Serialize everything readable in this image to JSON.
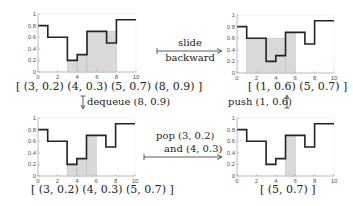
{
  "colors": {
    "line": "#222222",
    "fill": "#d9d9d9",
    "fill_edge": "#b5b5b5",
    "axis": "#9a9a9a",
    "grid": "#ececec"
  },
  "panels": [
    {
      "id": "top-left",
      "deque_label": "[ (3, 0.2) (4, 0.3) (5, 0.7) (8, 0.9) ]"
    },
    {
      "id": "top-right",
      "deque_label": "[ (1, 0.6) (5, 0.7) ]"
    },
    {
      "id": "bottom-left",
      "deque_label": "[ (3, 0.2) (4, 0.3) (5, 0.7) ]"
    },
    {
      "id": "bottom-right",
      "deque_label": "[ (5, 0.7) ]"
    }
  ],
  "operations": {
    "slide_line1": "slide",
    "slide_line2": "backward",
    "dequeue": "dequeue (8, 0.9)",
    "push": "push (1, 0.6)",
    "pop_line1": "pop (3, 0.2)",
    "pop_line2": "and (4, 0.3)"
  },
  "chart_data": [
    {
      "type": "line",
      "title": "top-left",
      "step_function": {
        "x": [
          0,
          1,
          3,
          4,
          5,
          7,
          8,
          10
        ],
        "y": [
          0.8,
          0.6,
          0.2,
          0.3,
          0.7,
          0.5,
          0.9,
          0.9
        ]
      },
      "shaded_steps": [
        {
          "x0": 3,
          "x1": 4,
          "y": 0.2
        },
        {
          "x0": 4,
          "x1": 5,
          "y": 0.3
        },
        {
          "x0": 5,
          "x1": 8,
          "y": 0.7
        }
      ],
      "xlim": [
        0,
        10
      ],
      "ylim": [
        0,
        1
      ],
      "xticks": [
        "0",
        "2",
        "4",
        "6",
        "8",
        "10"
      ],
      "yticks": [
        "0",
        "0.2",
        "0.4",
        "0.6",
        "0.8",
        "1"
      ]
    },
    {
      "type": "line",
      "title": "top-right",
      "step_function": {
        "x": [
          0,
          1,
          3,
          4,
          5,
          7,
          8,
          10
        ],
        "y": [
          0.8,
          0.6,
          0.2,
          0.3,
          0.7,
          0.5,
          0.9,
          0.9
        ]
      },
      "shaded_steps": [
        {
          "x0": 1,
          "x1": 5,
          "y": 0.6
        },
        {
          "x0": 5,
          "x1": 6,
          "y": 0.7
        }
      ],
      "xlim": [
        0,
        10
      ],
      "ylim": [
        0,
        1
      ],
      "xticks": [
        "0",
        "2",
        "4",
        "6",
        "8",
        "10"
      ],
      "yticks": [
        "0",
        "0.2",
        "0.4",
        "0.6",
        "0.8",
        "1"
      ]
    },
    {
      "type": "line",
      "title": "bottom-left",
      "step_function": {
        "x": [
          0,
          1,
          3,
          4,
          5,
          7,
          8,
          10
        ],
        "y": [
          0.8,
          0.6,
          0.2,
          0.3,
          0.7,
          0.5,
          0.9,
          0.9
        ]
      },
      "shaded_steps": [
        {
          "x0": 3,
          "x1": 4,
          "y": 0.2
        },
        {
          "x0": 4,
          "x1": 5,
          "y": 0.3
        },
        {
          "x0": 5,
          "x1": 6,
          "y": 0.7
        }
      ],
      "xlim": [
        0,
        10
      ],
      "ylim": [
        0,
        1
      ],
      "xticks": [
        "0",
        "2",
        "4",
        "6",
        "8",
        "10"
      ],
      "yticks": [
        "0",
        "0.2",
        "0.4",
        "0.6",
        "0.8",
        "1"
      ]
    },
    {
      "type": "line",
      "title": "bottom-right",
      "step_function": {
        "x": [
          0,
          1,
          3,
          4,
          5,
          7,
          8,
          10
        ],
        "y": [
          0.8,
          0.6,
          0.2,
          0.3,
          0.7,
          0.5,
          0.9,
          0.9
        ]
      },
      "shaded_steps": [
        {
          "x0": 5,
          "x1": 6,
          "y": 0.7
        }
      ],
      "xlim": [
        0,
        10
      ],
      "ylim": [
        0,
        1
      ],
      "xticks": [
        "0",
        "2",
        "4",
        "6",
        "8",
        "10"
      ],
      "yticks": [
        "0",
        "0.2",
        "0.4",
        "0.6",
        "0.8",
        "1"
      ]
    }
  ]
}
